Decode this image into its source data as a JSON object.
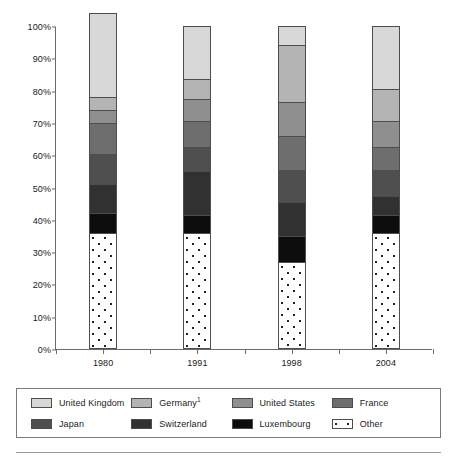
{
  "chart_data": {
    "type": "bar",
    "subtype": "stacked-100-percent",
    "title": "",
    "xlabel": "",
    "ylabel": "",
    "categories": [
      "1980",
      "1991",
      "1998",
      "2004"
    ],
    "ylim": [
      0,
      100
    ],
    "y_tick_labels": [
      "0%",
      "10%",
      "20%",
      "30%",
      "40%",
      "50%",
      "60%",
      "70%",
      "80%",
      "90%",
      "100%"
    ],
    "y_tick_values": [
      0,
      10,
      20,
      30,
      40,
      50,
      60,
      70,
      80,
      90,
      100
    ],
    "grid": false,
    "legend_position": "bottom",
    "stack_order_bottom_to_top": [
      "Other",
      "Luxembourg",
      "Switzerland",
      "Japan",
      "France",
      "United States",
      "Germany",
      "United Kingdom"
    ],
    "series": [
      {
        "name": "United Kingdom",
        "color": "#d8d8d8",
        "pattern": "solid",
        "values": [
          26.0,
          16.5,
          6.0,
          19.5
        ]
      },
      {
        "name": "Germany",
        "color": "#b4b4b4",
        "pattern": "solid",
        "values": [
          4.0,
          6.0,
          17.5,
          10.0
        ]
      },
      {
        "name": "United States",
        "color": "#8f8f8f",
        "pattern": "solid",
        "values": [
          4.0,
          7.0,
          10.5,
          8.0
        ]
      },
      {
        "name": "France",
        "color": "#6e6e6e",
        "pattern": "solid",
        "values": [
          9.5,
          8.0,
          10.5,
          7.0
        ]
      },
      {
        "name": "Japan",
        "color": "#4f4f4f",
        "pattern": "solid",
        "values": [
          9.5,
          7.5,
          10.0,
          8.0
        ]
      },
      {
        "name": "Switzerland",
        "color": "#313131",
        "pattern": "solid",
        "values": [
          9.0,
          13.5,
          10.5,
          6.0
        ]
      },
      {
        "name": "Luxembourg",
        "color": "#0d0d0d",
        "pattern": "solid",
        "values": [
          6.0,
          5.5,
          8.0,
          5.5
        ]
      },
      {
        "name": "Other",
        "color": "#ffffff",
        "pattern": "dotted",
        "values": [
          36.0,
          36.0,
          27.0,
          36.0
        ]
      }
    ],
    "cumulative_tops": {
      "1980": {
        "Other": 36.0,
        "Luxembourg": 42.0,
        "Switzerland": 51.0,
        "Japan": 60.5,
        "France": 70.0,
        "United States": 74.0,
        "Germany": 78.0,
        "United Kingdom": 100.0
      },
      "1991": {
        "Other": 36.0,
        "Luxembourg": 41.5,
        "Switzerland": 55.0,
        "Japan": 62.5,
        "France": 70.5,
        "United States": 77.5,
        "Germany": 83.5,
        "United Kingdom": 100.0
      },
      "1998": {
        "Other": 27.0,
        "Luxembourg": 35.0,
        "Switzerland": 45.5,
        "Japan": 55.5,
        "France": 66.0,
        "United States": 76.5,
        "Germany": 94.0,
        "United Kingdom": 100.0
      },
      "2004": {
        "Other": 36.0,
        "Luxembourg": 41.5,
        "Switzerland": 47.5,
        "Japan": 55.5,
        "France": 62.5,
        "United States": 70.5,
        "Germany": 80.5,
        "United Kingdom": 100.0
      }
    }
  },
  "legend": {
    "entries": [
      {
        "label": "United Kingdom",
        "label_sup": "",
        "color": "#d8d8d8",
        "pattern": "solid"
      },
      {
        "label": "Germany",
        "label_sup": "1",
        "color": "#b4b4b4",
        "pattern": "solid"
      },
      {
        "label": "United States",
        "label_sup": "",
        "color": "#8f8f8f",
        "pattern": "solid"
      },
      {
        "label": "France",
        "label_sup": "",
        "color": "#6e6e6e",
        "pattern": "solid"
      },
      {
        "label": "Japan",
        "label_sup": "",
        "color": "#4f4f4f",
        "pattern": "solid"
      },
      {
        "label": "Switzerland",
        "label_sup": "",
        "color": "#313131",
        "pattern": "solid"
      },
      {
        "label": "Luxembourg",
        "label_sup": "",
        "color": "#0d0d0d",
        "pattern": "solid"
      },
      {
        "label": "Other",
        "label_sup": "",
        "color": "#ffffff",
        "pattern": "dotted"
      }
    ]
  },
  "axis_colors": {
    "frame": "#6b6b6b",
    "segment_border": "#4d4d4d",
    "text": "#1a1a1a"
  }
}
